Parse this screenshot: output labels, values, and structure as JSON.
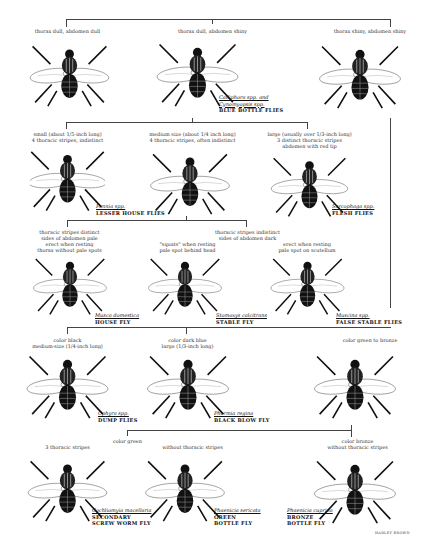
{
  "diagram": {
    "type": "dichotomous-key",
    "level1": {
      "branches": [
        {
          "label": "thorax dull, abdomen dull"
        },
        {
          "label": "thorax dull, abdomen shiny",
          "sci": "Calliphora spp. and\nCynomyopsis spp.",
          "common": "BLUE BOTTLE FLIES"
        },
        {
          "label": "thorax shiny, abdomen shiny"
        }
      ]
    },
    "level2": {
      "branches": [
        {
          "label": "small (about 1/5-inch long)\n4 thoracic stripes, indistinct",
          "sci": "Fannia spp.",
          "common": "LESSER HOUSE FLIES"
        },
        {
          "label": "medium size (about 1/4 inch long)\n4 thoracic stripes, often indistinct"
        },
        {
          "label": "large (usually over 1/3-inch long)\n3 distinct thoracic stripes\nabdomen with red tip",
          "sci": "Sarcophaga spp.",
          "common": "FLESH FLIES"
        }
      ]
    },
    "level3": {
      "branches": [
        {
          "label": "thoracic stripes distinct\nsides of abdomen pale\nerect when resting\nthorax without pale spots",
          "sci": "Musca domestica",
          "common": "HOUSE FLY"
        },
        {
          "label": "thoracic stripes indistinct\nsides of abdomen dark",
          "sub": [
            {
              "label": "\"squats\" when resting\npale spot behind head",
              "sci": "Stomoxys calcitrans",
              "common": "STABLE FLY"
            },
            {
              "label": "erect when resting\npale spot on scutellum",
              "sci": "Muscina spp.",
              "common": "FALSE STABLE FLIES"
            }
          ]
        }
      ]
    },
    "level4": {
      "branches": [
        {
          "label": "color black\nmedium-size (1/4-inch long)",
          "sci": "Ophyra spp.",
          "common": "DUMP FLIES"
        },
        {
          "label": "color dark blue\nlarge (1/3-inch long)",
          "sci": "Phormia regina",
          "common": "BLACK BLOW FLY"
        },
        {
          "label": "color green to bronze"
        }
      ]
    },
    "level5": {
      "branches": [
        {
          "label": "color green"
        },
        {
          "label": "color bronze\nwithout thoracic stripes",
          "sci": "Phaenicia cuprina",
          "common": "BRONZE\nBOTTLE FLY"
        }
      ],
      "green": [
        {
          "label": "3 thoracic stripes",
          "sci": "Cochliomyia macellaria",
          "common": "SECONDARY\nSCREW WORM FLY"
        },
        {
          "label": "without thoracic stripes",
          "sci": "Phaenicia sericata",
          "common": "GREEN\nBOTTLE FLY"
        }
      ]
    },
    "credit": "HARLEY BROWN"
  }
}
